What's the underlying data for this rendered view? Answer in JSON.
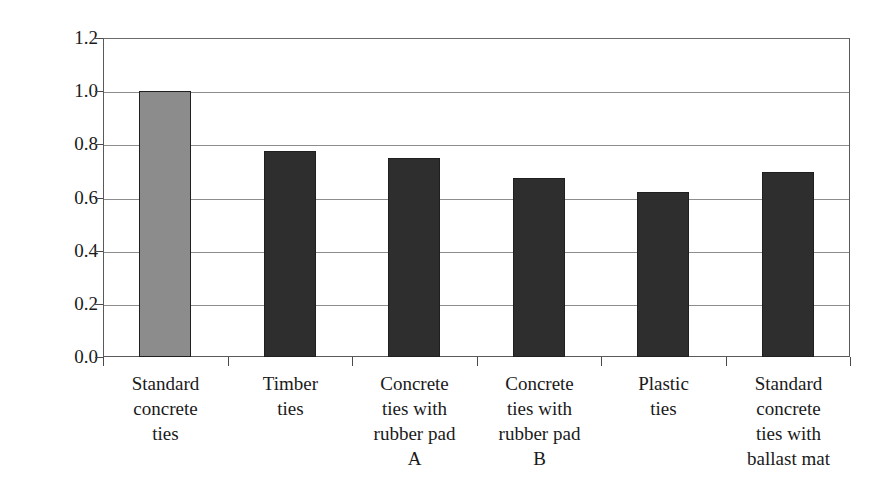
{
  "chart_data": {
    "type": "bar",
    "title": "",
    "subtitle": "",
    "xlabel": "",
    "ylabel": "Impact ratio for midspan bending",
    "categories": [
      "Standard concrete ties",
      "Timber ties",
      "Concrete ties with rubber pad A",
      "Concrete ties with rubber pad B",
      "Plastic ties",
      "Standard concrete ties with ballast mat"
    ],
    "category_lines": [
      [
        "Standard",
        "concrete",
        "ties"
      ],
      [
        "Timber",
        "ties"
      ],
      [
        "Concrete",
        "ties with",
        "rubber pad",
        "A"
      ],
      [
        "Concrete",
        "ties with",
        "rubber pad",
        "B"
      ],
      [
        "Plastic",
        "ties"
      ],
      [
        "Standard",
        "concrete",
        "ties with",
        "ballast mat"
      ]
    ],
    "values": [
      1.0,
      0.775,
      0.75,
      0.672,
      0.62,
      0.695
    ],
    "bar_colors": [
      "#8c8c8c",
      "#2e2e2e",
      "#2e2e2e",
      "#2e2e2e",
      "#2e2e2e",
      "#2e2e2e"
    ],
    "bar_border_color": "#1f1f1f",
    "ylim": [
      0.0,
      1.2
    ],
    "y_ticks": [
      "0.0",
      "0.2",
      "0.4",
      "0.6",
      "0.8",
      "1.0",
      "1.2"
    ],
    "y_tick_values": [
      0.0,
      0.2,
      0.4,
      0.6,
      0.8,
      1.0,
      1.2
    ],
    "grid": "horizontal",
    "legend": "none",
    "legend_position": "none",
    "highlight_color": "#8c8c8c",
    "series_color": "#2e2e2e",
    "axis_color": "#5a5a5a",
    "gridline_color": "#8d8d8d",
    "background": "#ffffff"
  }
}
